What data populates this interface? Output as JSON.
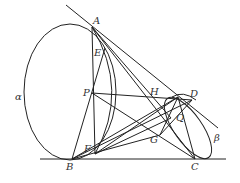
{
  "diagram": {
    "type": "geometry-figure",
    "labels": {
      "A": "A",
      "E": "E",
      "P": "P",
      "H": "H",
      "D": "D",
      "Q": "Q",
      "G": "G",
      "F": "F",
      "B": "B",
      "C": "C",
      "alpha": "α",
      "beta": "β"
    },
    "stroke_color": "#222222",
    "points": {
      "A": [
        92,
        27
      ],
      "E": [
        105,
        48
      ],
      "P": [
        92,
        93
      ],
      "H": [
        178,
        97
      ],
      "D": [
        192,
        100
      ],
      "Q": [
        171,
        118
      ],
      "G": [
        160,
        135
      ],
      "F": [
        95,
        154
      ],
      "B": [
        72,
        159
      ],
      "C": [
        195,
        159
      ]
    }
  }
}
